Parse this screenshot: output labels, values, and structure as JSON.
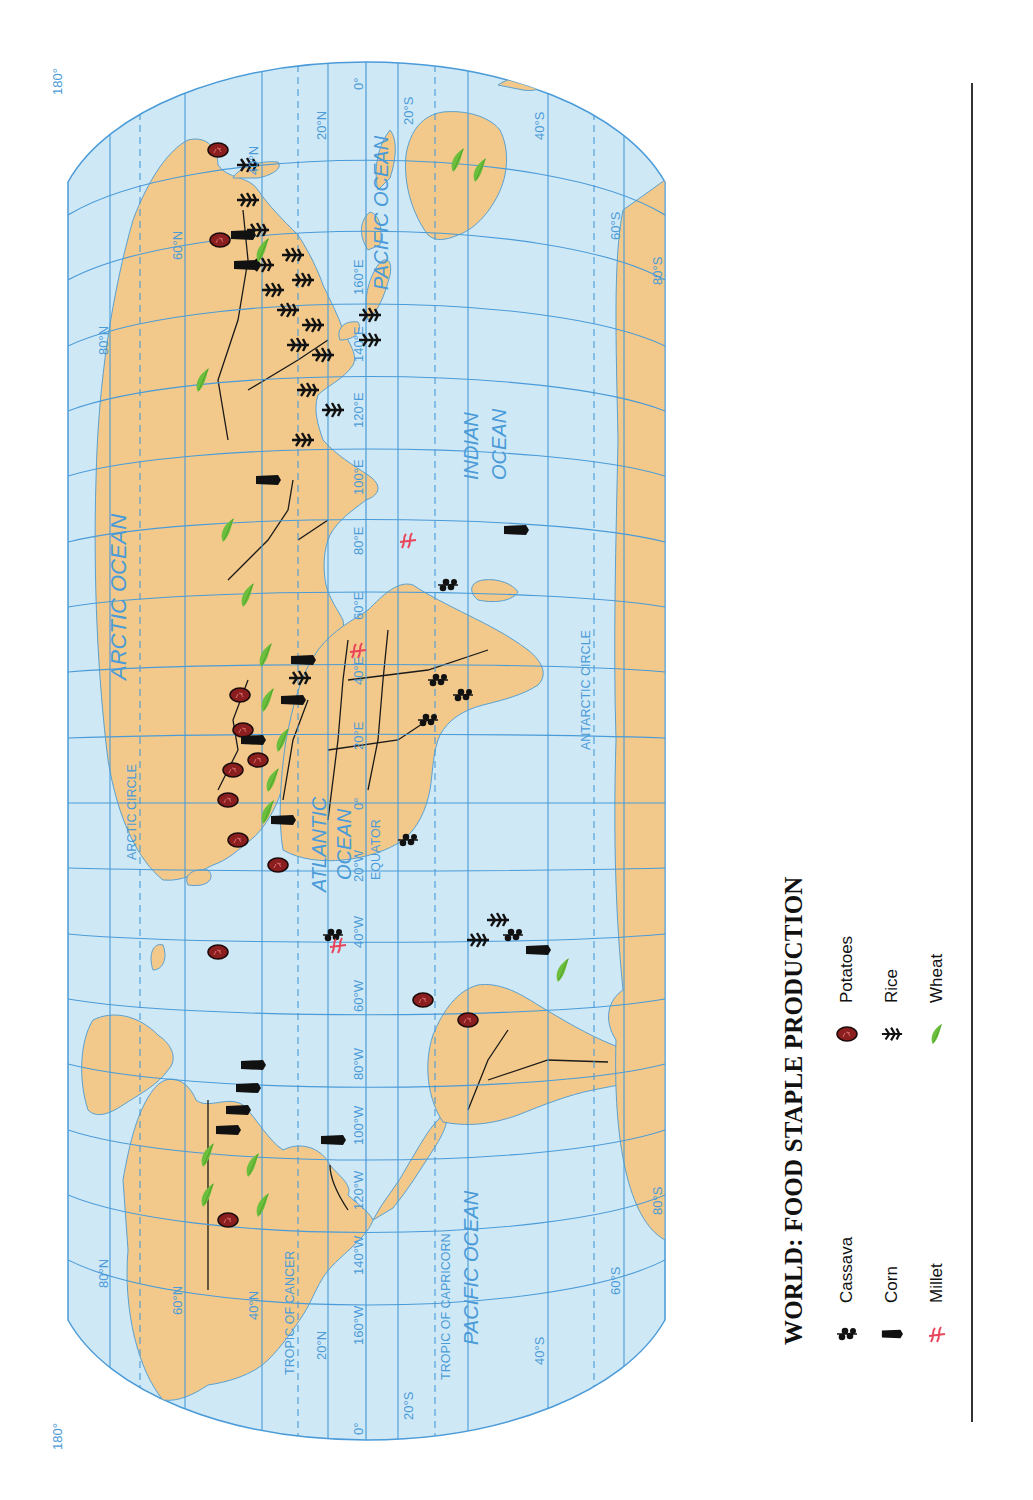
{
  "title": "WORLD: FOOD STAPLE PRODUCTION",
  "legend": {
    "items": [
      {
        "key": "cassava",
        "label": "Cassava",
        "icon": "cassava-icon"
      },
      {
        "key": "corn",
        "label": "Corn",
        "icon": "corn-icon"
      },
      {
        "key": "millet",
        "label": "Millet",
        "icon": "millet-icon"
      },
      {
        "key": "potatoes",
        "label": "Potatoes",
        "icon": "potato-icon"
      },
      {
        "key": "rice",
        "label": "Rice",
        "icon": "rice-icon"
      },
      {
        "key": "wheat",
        "label": "Wheat",
        "icon": "wheat-icon"
      }
    ]
  },
  "colors": {
    "ocean": "#cfe8f6",
    "land": "#f2c98a",
    "grid": "#4a9bd8",
    "border": "#1a1a1a",
    "potato": "#8b1e1e",
    "wheat": "#6cbf3c",
    "millet": "#e8455a",
    "corn": "#111111",
    "rice": "#111111",
    "cassava": "#111111"
  },
  "oceans": {
    "arctic": "ARCTIC OCEAN",
    "atlantic_line1": "ATLANTIC",
    "atlantic_line2": "OCEAN",
    "pacific_east": "PACIFIC OCEAN",
    "pacific_west": "PACIFIC OCEAN",
    "indian_line1": "INDIAN",
    "indian_line2": "OCEAN"
  },
  "special_lines": {
    "arctic_circle": "ARCTIC CIRCLE",
    "tropic_of_cancer": "TROPIC OF CANCER",
    "equator": "EQUATOR",
    "tropic_of_capricorn": "TROPIC OF CAPRICORN",
    "antarctic_circle": "ANTARCTIC CIRCLE"
  },
  "grid_labels": {
    "lat_west": [
      "80°N",
      "60°N",
      "40°N",
      "20°N",
      "0°",
      "20°S",
      "40°S",
      "60°S",
      "80°S"
    ],
    "lat_east": [
      "80°N",
      "60°N",
      "40°N",
      "20°N",
      "0°",
      "20°S",
      "40°S",
      "60°S",
      "80°S"
    ],
    "lon_bottom": [
      "160°W",
      "140°W",
      "120°W",
      "100°W",
      "80°W",
      "60°W",
      "40°W",
      "20°W",
      "0°",
      "20°E",
      "40°E",
      "60°E",
      "80°E",
      "100°E",
      "120°E",
      "140°E",
      "160°E"
    ],
    "edge_180_left": "180°",
    "edge_180_right": "180°"
  }
}
